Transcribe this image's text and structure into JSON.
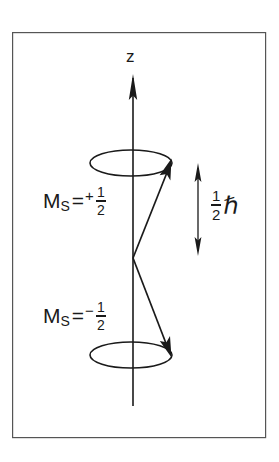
{
  "figure": {
    "kind": "vector-model-spin-diagram",
    "background_color": "#ffffff",
    "ink_color": "#1a1a1a",
    "frame": {
      "name": "figure-border",
      "x": 12,
      "y": 32,
      "width": 254,
      "height": 406,
      "stroke": "#555555",
      "stroke_width": 1.2
    },
    "axis": {
      "label": "z",
      "x": 133,
      "top_y": 75,
      "bottom_y": 406,
      "arrow_direction": "up"
    },
    "cones": [
      {
        "name": "upper-precession-circle",
        "cx": 131,
        "cy": 163,
        "rx": 41,
        "ry": 13
      },
      {
        "name": "lower-precession-circle",
        "cx": 131,
        "cy": 355,
        "rx": 41,
        "ry": 13
      }
    ],
    "origin": {
      "x": 133,
      "y": 258
    },
    "vectors": [
      {
        "name": "spin-up-vector",
        "from_x": 133,
        "from_y": 258,
        "to_x": 170,
        "to_y": 164
      },
      {
        "name": "spin-down-vector",
        "from_x": 133,
        "from_y": 258,
        "to_x": 170,
        "to_y": 353
      }
    ],
    "measure_arrow": {
      "name": "hbar-measure-arrow",
      "x": 198,
      "top_y": 165,
      "bottom_y": 254,
      "double_headed": true
    },
    "labels": {
      "axis_z": "z",
      "ms_up": {
        "symbol": "M",
        "subscript": "S",
        "equals": "=",
        "sign": "+",
        "numerator": "1",
        "denominator": "2"
      },
      "ms_down": {
        "symbol": "M",
        "subscript": "S",
        "equals": "=",
        "sign": "−",
        "numerator": "1",
        "denominator": "2"
      },
      "hbar": {
        "numerator": "1",
        "denominator": "2",
        "glyph": "ℏ"
      }
    }
  }
}
